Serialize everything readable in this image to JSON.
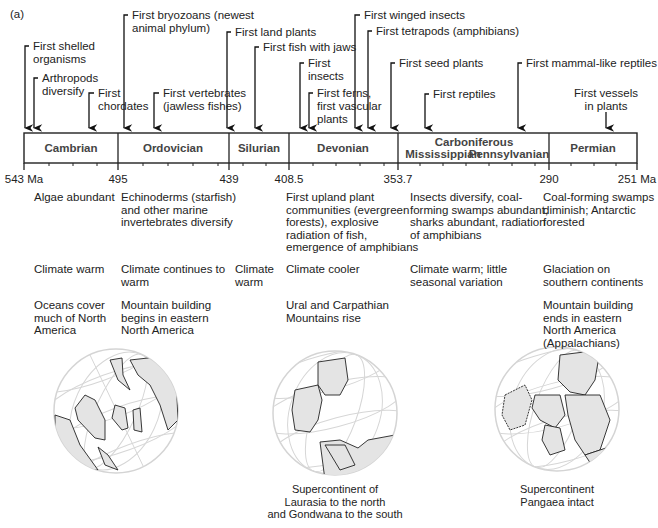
{
  "figure": {
    "panel_label": "(a)",
    "accent_colors": {
      "land_fill": "#e4e4e4",
      "grid": "#d0d0d0",
      "line": "#222222"
    }
  },
  "timeline": {
    "unit": "Ma",
    "boundaries": [
      {
        "value": "543 Ma",
        "x": 24
      },
      {
        "value": "495",
        "x": 118
      },
      {
        "value": "439",
        "x": 229
      },
      {
        "value": "408.5",
        "x": 289
      },
      {
        "value": "353.7",
        "x": 398
      },
      {
        "value": "290",
        "x": 549
      },
      {
        "value": "251 Ma",
        "x": 637
      }
    ],
    "periods": [
      {
        "name": "Cambrian",
        "start": "543",
        "end": "495"
      },
      {
        "name": "Ordovician",
        "start": "495",
        "end": "439"
      },
      {
        "name": "Silurian",
        "start": "439",
        "end": "408.5"
      },
      {
        "name": "Devonian",
        "start": "408.5",
        "end": "353.7"
      },
      {
        "name": "Carboniferous",
        "start": "353.7",
        "end": "290",
        "subdivisions": [
          "Mississippian",
          "Pennsylvanian"
        ]
      },
      {
        "name": "Permian",
        "start": "290",
        "end": "251"
      }
    ]
  },
  "events": [
    {
      "label": "First shelled\norganisms",
      "arrow_x": 25
    },
    {
      "label": "Arthropods\ndiversify",
      "arrow_x": 34
    },
    {
      "label": "First\nchordates",
      "arrow_x": 89
    },
    {
      "label": "First bryozoans (newest\nanimal phylum)",
      "arrow_x": 124
    },
    {
      "label": "First vertebrates\n(jawless fishes)",
      "arrow_x": 154
    },
    {
      "label": "First land plants",
      "arrow_x": 227
    },
    {
      "label": "First fish with jaws",
      "arrow_x": 255
    },
    {
      "label": "First\ninsects",
      "arrow_x": 300
    },
    {
      "label": "First ferns,\nfirst vascular\nplants",
      "arrow_x": 309
    },
    {
      "label": "First winged insects",
      "arrow_x": 355
    },
    {
      "label": "First tetrapods (amphibians)",
      "arrow_x": 368
    },
    {
      "label": "First seed plants",
      "arrow_x": 391
    },
    {
      "label": "First reptiles",
      "arrow_x": 425
    },
    {
      "label": "First mammal-like reptiles",
      "arrow_x": 518
    },
    {
      "label": "First vessels\nin plants",
      "arrow_x": 606
    }
  ],
  "descriptions": {
    "life": [
      "Algae abundant",
      "Echinoderms (starfish)\nand other marine\ninvertebrates diversify",
      "First upland plant\ncommunities (evergreen\nforests), explosive\nradiation of fish,\nemergence of amphibians",
      "Insects diversify, coal-\nforming swamps abundant,\nsharks abundant, radiation\nof amphibians",
      "Coal-forming swamps\ndiminish; Antarctic\nforested"
    ],
    "climate": [
      "Climate warm",
      "Climate continues to\nwarm",
      "Climate\nwarm",
      "Climate cooler",
      "Climate warm; little\nseasonal variation",
      "Glaciation on\nsouthern continents"
    ],
    "geology": [
      "Oceans cover\nmuch of North\nAmerica",
      "Mountain building\nbegins in eastern\nNorth America",
      "Ural and Carpathian\nMountains rise",
      "Mountain building\nends in eastern\nNorth America\n(Appalachians)"
    ]
  },
  "globes": [
    {
      "name": "early-paleozoic-globe",
      "caption": ""
    },
    {
      "name": "devonian-globe",
      "caption": "Supercontinent of\nLaurasia to the north\nand Gondwana to the south"
    },
    {
      "name": "permian-globe",
      "caption": "Supercontinent\nPangaea intact"
    }
  ]
}
